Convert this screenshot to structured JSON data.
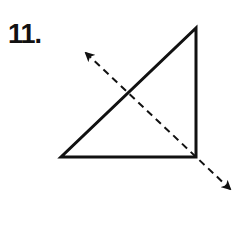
{
  "problem": {
    "number_label": "11."
  },
  "figure": {
    "type": "right-triangle-with-reflection-line",
    "stroke_color": "#111111",
    "triangle": {
      "vertices": [
        [
          61,
          157
        ],
        [
          196,
          157
        ],
        [
          196,
          28
        ]
      ],
      "right_angle_at": [
        196,
        157
      ]
    },
    "line_of_reflection": {
      "style": "dashed",
      "start": [
        84,
        51
      ],
      "end": [
        232,
        191
      ],
      "arrowheads": "both"
    }
  }
}
